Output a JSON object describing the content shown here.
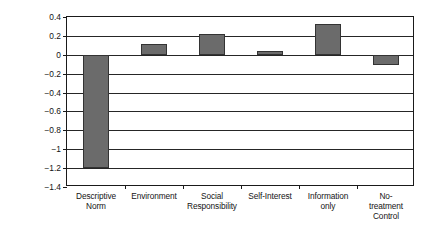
{
  "chart_data": {
    "type": "bar",
    "title": "",
    "xlabel": "",
    "ylabel": "Change in Daily Energy\nConsumption",
    "categories": [
      "Descriptive\nNorm",
      "Environment",
      "Social\nResponsibility",
      "Self-Interest",
      "Information\nonly",
      "No-treatment\nControl"
    ],
    "values": [
      -1.2,
      0.11,
      0.22,
      0.04,
      0.33,
      -0.11
    ],
    "ylim": [
      -1.4,
      0.4
    ],
    "yticks": [
      0.4,
      0.2,
      0,
      -0.2,
      -0.4,
      -0.6,
      -0.8,
      -1,
      -1.2,
      -1.4
    ],
    "ytick_labels": [
      "0.4",
      "0.2",
      "0",
      "−0.2",
      "−0.4",
      "−0.6",
      "−0.8",
      "−1",
      "−1.2",
      "−1.4"
    ],
    "grid": true,
    "legend": false,
    "bar_color": "#6b6b6b",
    "bar_edge_color": "#333333",
    "axis_color": "#1a1a1a",
    "background_color": "#ffffff"
  }
}
